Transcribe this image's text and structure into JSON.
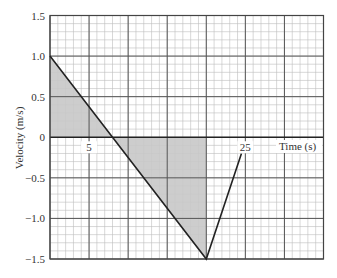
{
  "chart_data": {
    "type": "line",
    "title": "",
    "xlabel": "Time (s)",
    "ylabel": "Velocity (m/s)",
    "xlim": [
      0,
      35
    ],
    "ylim": [
      -1.5,
      1.5
    ],
    "x_ticks_labeled": [
      5,
      25
    ],
    "y_ticks": [
      1.5,
      1.0,
      0.5,
      0,
      -0.5,
      -1.0,
      -1.5
    ],
    "y_tick_labels": [
      "1.5",
      "1.0",
      "0.5",
      "0",
      "−0.5",
      "−1.0",
      "−1.5"
    ],
    "x_tick_labels": [
      "5",
      "25"
    ],
    "grid": {
      "major_x_step": 5,
      "minor_x_step": 1,
      "major_y_step": 0.5,
      "minor_y_step": 0.1
    },
    "series": [
      {
        "name": "velocity",
        "x": [
          0,
          8,
          20,
          24.5
        ],
        "y": [
          1.0,
          0,
          -1.5,
          -0.2
        ]
      }
    ],
    "shaded_regions": [
      {
        "name": "positive-area",
        "points": [
          [
            0,
            0
          ],
          [
            0,
            1.0
          ],
          [
            8,
            0
          ]
        ]
      },
      {
        "name": "negative-area",
        "points": [
          [
            8,
            0
          ],
          [
            20,
            0
          ],
          [
            20,
            -1.5
          ]
        ]
      }
    ],
    "colors": {
      "line": "#222222",
      "fill": "#c8c8c8",
      "major_grid": "#555555",
      "minor_grid": "#bdbdbd"
    }
  }
}
